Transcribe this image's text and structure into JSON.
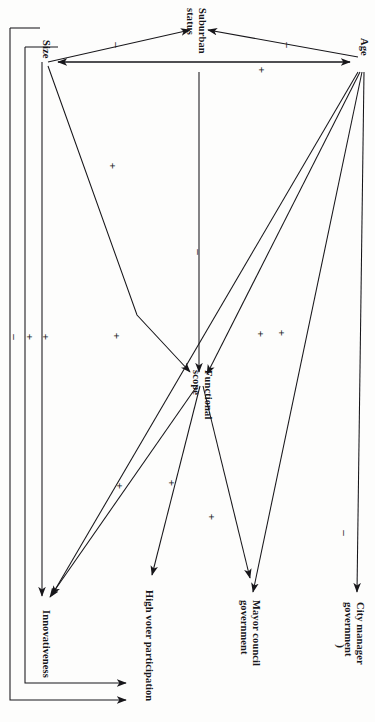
{
  "diagram": {
    "orientation": "rotated-90-clockwise",
    "nodes": [
      {
        "id": "suburban_status",
        "label": "Suburban status",
        "label_lines": [
          "Suburban",
          "status"
        ],
        "x": 193,
        "y": 18
      },
      {
        "id": "size",
        "label": "Size",
        "label_lines": [
          "Size"
        ],
        "x": 42,
        "y": 50
      },
      {
        "id": "age",
        "label": "Age",
        "label_lines": [
          "Age"
        ],
        "x": 362,
        "y": 45
      },
      {
        "id": "functional_scope",
        "label": "Functional scope",
        "label_lines": [
          "Functional",
          "scope"
        ],
        "x": 200,
        "y": 380
      },
      {
        "id": "innovativeness",
        "label": "Innovativeness",
        "label_lines": [
          "Innovativeness"
        ],
        "x": 45,
        "y": 608
      },
      {
        "id": "high_voter_participation",
        "label": "High voter participation",
        "label_lines": [
          "High voter participation"
        ],
        "x": 148,
        "y": 588
      },
      {
        "id": "mayor_council_government",
        "label": "Mayor council government",
        "label_lines": [
          "Mayor council",
          "government"
        ],
        "x": 253,
        "y": 598
      },
      {
        "id": "city_manager_government",
        "label": "City manager government",
        "label_lines": [
          "City manager",
          "government"
        ],
        "x": 358,
        "y": 600
      }
    ],
    "edges": [
      {
        "from": "size",
        "to": "suburban_status",
        "sign": "–",
        "sign_x": 117,
        "sign_y": 45
      },
      {
        "from": "age",
        "to": "suburban_status",
        "sign": "–",
        "sign_x": 288,
        "sign_y": 45
      },
      {
        "from": "age",
        "to": "size",
        "sign": "+",
        "sign_x": 262,
        "sign_y": 70
      },
      {
        "from": "suburban_status",
        "to": "functional_scope",
        "sign": "–",
        "sign_x": 199,
        "sign_y": 252
      },
      {
        "from": "size",
        "to": "functional_scope",
        "sign": "+",
        "sign_x": 113,
        "sign_y": 166
      },
      {
        "from": "size",
        "to": "innovativeness",
        "sign": "+",
        "sign_x": 46,
        "sign_y": 337
      },
      {
        "from": "size",
        "to": "high_voter_participation",
        "sign": "+",
        "sign_x": 30,
        "sign_y": 337
      },
      {
        "from": "suburban_status",
        "to": "innovativeness",
        "sign": "–",
        "sign_x": 15,
        "sign_y": 337
      },
      {
        "from": "age",
        "to": "functional_scope",
        "sign": "+",
        "sign_x": 282,
        "sign_y": 333
      },
      {
        "from": "age",
        "to": "innovativeness",
        "sign": "+",
        "sign_x": 117,
        "sign_y": 336
      },
      {
        "from": "age",
        "to": "mayor_council_government",
        "sign": "+",
        "sign_x": 261,
        "sign_y": 334
      },
      {
        "from": "age",
        "to": "city_manager_government",
        "sign": "–",
        "sign_x": 345,
        "sign_y": 533
      },
      {
        "from": "functional_scope",
        "to": "innovativeness",
        "sign": "+",
        "sign_x": 120,
        "sign_y": 486
      },
      {
        "from": "functional_scope",
        "to": "high_voter_participation",
        "sign": "+",
        "sign_x": 172,
        "sign_y": 483
      },
      {
        "from": "functional_scope",
        "to": "mayor_council_government",
        "sign": "+",
        "sign_x": 212,
        "sign_y": 517
      }
    ],
    "stray_mark": {
      "glyph": ")",
      "x": 341,
      "y": 645
    }
  }
}
